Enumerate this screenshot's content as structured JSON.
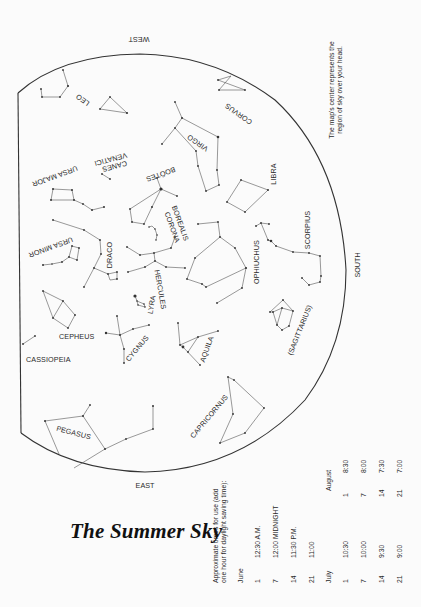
{
  "title": "The Summer Sky",
  "directions": {
    "west": "WEST",
    "east": "EAST",
    "south": "SOUTH"
  },
  "note": {
    "line1": "The map's center represents the",
    "line2": "region of sky over your head."
  },
  "constellations": {
    "leo": "LEO",
    "corvus": "CORVUS",
    "virgo": "VIRGO",
    "ursa_major": "URSA MAJOR",
    "canes_venatici_1": "CANES",
    "canes_venatici_2": "VENATICI",
    "bootes": "BOÖTES",
    "libra": "LIBRA",
    "corona_borealis_1": "CORONA",
    "corona_borealis_2": "BOREALIS",
    "ursa_minor": "URSA MINOR",
    "draco": "DRACO",
    "scorpius": "SCORPIUS",
    "ophiuchus": "OPHIUCHUS",
    "hercules": "HERCULES",
    "lyra": "LYRA",
    "cepheus": "CEPHEUS",
    "cygnus": "CYGNUS",
    "cassiopeia": "CASSIOPEIA",
    "aquila": "AQUILA",
    "sagittarius": "(SAGITTARIUS)",
    "pegasus": "PEGASUS",
    "capricornus": "CAPRICORNUS"
  },
  "times_table": {
    "intro_line1": "Approximate times for use (add",
    "intro_line2": "one hour for daylight saving time):",
    "months": [
      {
        "name": "June",
        "rows": [
          {
            "day": "1",
            "time": "12:30 A.M."
          },
          {
            "day": "7",
            "time": "12:00 MIDNIGHT"
          },
          {
            "day": "14",
            "time": "11:30 P.M."
          },
          {
            "day": "21",
            "time": "11:00"
          }
        ]
      },
      {
        "name": "July",
        "rows": [
          {
            "day": "1",
            "time": "10:30"
          },
          {
            "day": "7",
            "time": "10:00"
          },
          {
            "day": "14",
            "time": "9:30"
          },
          {
            "day": "21",
            "time": "9:00"
          }
        ]
      },
      {
        "name": "August",
        "rows": [
          {
            "day": "1",
            "time": "8:30"
          },
          {
            "day": "7",
            "time": "8:00"
          },
          {
            "day": "14",
            "time": "7:30"
          },
          {
            "day": "21",
            "time": "7:00"
          }
        ]
      }
    ]
  },
  "colors": {
    "background": "#fbfbfb",
    "ink": "#2a2a2a",
    "lines": "#555555"
  }
}
